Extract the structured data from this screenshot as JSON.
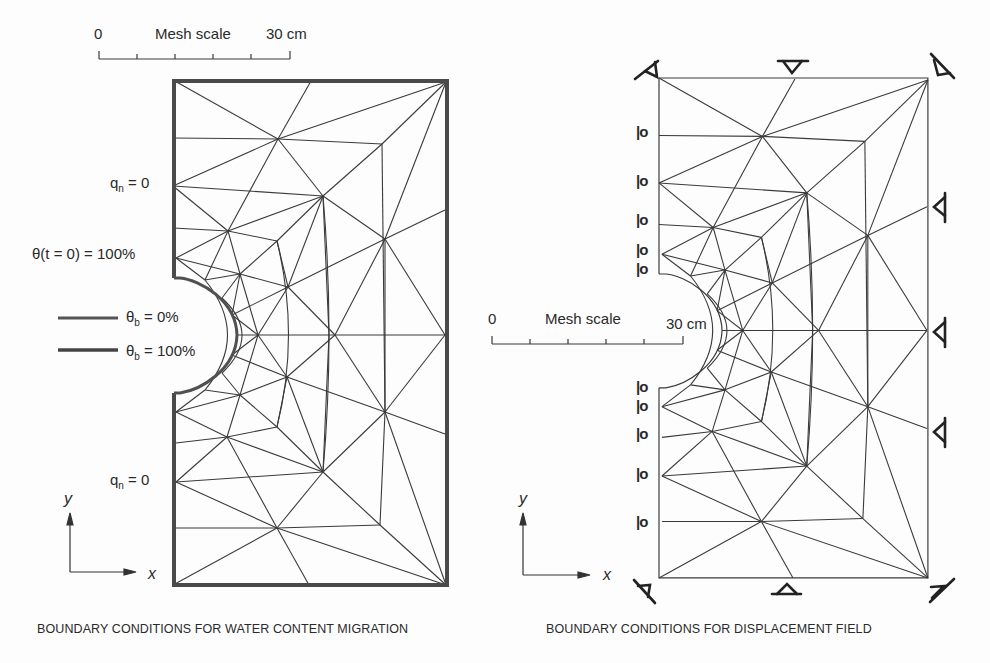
{
  "colors": {
    "background": "#fdfdfd",
    "ink": "#2a2a2a",
    "mesh": "#3a3a3a",
    "boundary_thick": "#555555"
  },
  "left_figure": {
    "caption": "BOUNDARY CONDITIONS FOR WATER CONTENT MIGRATION",
    "mesh_scale": {
      "start": "0",
      "label": "Mesh scale",
      "end": "30 cm",
      "ticks": 6
    },
    "labels": {
      "qn_top": {
        "main": "q",
        "sub": "n",
        "rest": " = 0"
      },
      "theta_init": "θ(t = 0) = 100%",
      "theta_b0": {
        "main": "θ",
        "sub": "b",
        "rest": " = 0%"
      },
      "theta_b100": {
        "main": "θ",
        "sub": "b",
        "rest": " = 100%"
      },
      "qn_bottom": {
        "main": "q",
        "sub": "n",
        "rest": " = 0"
      }
    },
    "axes": {
      "x": "x",
      "y": "y"
    }
  },
  "right_figure": {
    "caption": "BOUNDARY CONDITIONS FOR DISPLACEMENT FIELD",
    "mesh_scale": {
      "start": "0",
      "label": "Mesh scale",
      "end": "30 cm",
      "ticks": 6
    },
    "roller_symbol": "|o",
    "roller_count_left": 10,
    "pin_supports": {
      "top": 3,
      "right": 3,
      "bottom": 3
    },
    "axes": {
      "x": "x",
      "y": "y"
    }
  }
}
